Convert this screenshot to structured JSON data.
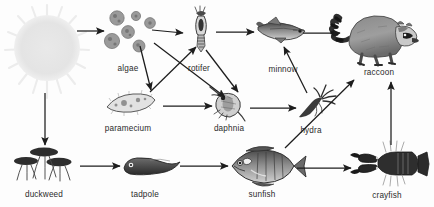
{
  "diagram": {
    "type": "food-web",
    "background_color": "#fdfdfd",
    "arrow_color": "#1d1d1d",
    "label_color": "#2b2b2b",
    "organism_ink": "#3a3a3a",
    "sun_color": "#e6e6e6"
  },
  "nodes": [
    {
      "id": "sun",
      "label": "",
      "x": 47,
      "y": 48,
      "label_x": 47,
      "label_y": 96,
      "kind": "energy-source"
    },
    {
      "id": "algae",
      "label": "algae",
      "x": 131,
      "y": 30,
      "label_x": 128,
      "label_y": 64,
      "kind": "producer"
    },
    {
      "id": "rotifer",
      "label": "rotifer",
      "x": 201,
      "y": 32,
      "label_x": 199,
      "label_y": 64,
      "kind": "primary-consumer"
    },
    {
      "id": "minnow",
      "label": "minnow",
      "x": 283,
      "y": 30,
      "label_x": 283,
      "label_y": 65,
      "kind": "secondary-consumer"
    },
    {
      "id": "raccoon",
      "label": "raccoon",
      "x": 381,
      "y": 33,
      "label_x": 379,
      "label_y": 68,
      "kind": "top-predator"
    },
    {
      "id": "paramecium",
      "label": "paramecium",
      "x": 131,
      "y": 103,
      "label_x": 128,
      "label_y": 124,
      "kind": "primary-consumer"
    },
    {
      "id": "daphnia",
      "label": "daphnia",
      "x": 230,
      "y": 104,
      "label_x": 229,
      "label_y": 124,
      "kind": "primary-consumer"
    },
    {
      "id": "hydra",
      "label": "hydra",
      "x": 313,
      "y": 104,
      "label_x": 311,
      "label_y": 126,
      "kind": "secondary-consumer"
    },
    {
      "id": "duckweed",
      "label": "duckweed",
      "x": 44,
      "y": 165,
      "label_x": 44,
      "label_y": 190,
      "kind": "producer"
    },
    {
      "id": "tadpole",
      "label": "tadpole",
      "x": 145,
      "y": 166,
      "label_x": 145,
      "label_y": 190,
      "kind": "primary-consumer"
    },
    {
      "id": "sunfish",
      "label": "sunfish",
      "x": 262,
      "y": 165,
      "label_x": 262,
      "label_y": 190,
      "kind": "secondary-consumer"
    },
    {
      "id": "crayfish",
      "label": "crayfish",
      "x": 389,
      "y": 165,
      "label_x": 387,
      "label_y": 191,
      "kind": "secondary-consumer"
    }
  ],
  "links": [
    {
      "from": "sun",
      "to": "algae",
      "x1": 77,
      "y1": 31,
      "x2": 104,
      "y2": 31
    },
    {
      "from": "sun",
      "to": "duckweed",
      "x1": 45,
      "y1": 93,
      "x2": 45,
      "y2": 145
    },
    {
      "from": "algae",
      "to": "rotifer",
      "x1": 152,
      "y1": 30,
      "x2": 183,
      "y2": 33
    },
    {
      "from": "algae",
      "to": "paramecium",
      "x1": 140,
      "y1": 46,
      "x2": 151,
      "y2": 90
    },
    {
      "from": "algae",
      "to": "daphnia",
      "x1": 154,
      "y1": 43,
      "x2": 225,
      "y2": 97
    },
    {
      "from": "paramecium",
      "to": "rotifer",
      "x1": 150,
      "y1": 92,
      "x2": 196,
      "y2": 47
    },
    {
      "from": "paramecium",
      "to": "daphnia",
      "x1": 163,
      "y1": 106,
      "x2": 212,
      "y2": 106
    },
    {
      "from": "rotifer",
      "to": "daphnia",
      "x1": 206,
      "y1": 50,
      "x2": 238,
      "y2": 92
    },
    {
      "from": "rotifer",
      "to": "minnow",
      "x1": 216,
      "y1": 32,
      "x2": 254,
      "y2": 32
    },
    {
      "from": "daphnia",
      "to": "hydra",
      "x1": 250,
      "y1": 108,
      "x2": 296,
      "y2": 108
    },
    {
      "from": "hydra",
      "to": "minnow",
      "x1": 307,
      "y1": 93,
      "x2": 284,
      "y2": 47
    },
    {
      "from": "minnow",
      "to": "raccoon",
      "x1": 303,
      "y1": 33,
      "x2": 340,
      "y2": 33
    },
    {
      "from": "duckweed",
      "to": "tadpole",
      "x1": 80,
      "y1": 166,
      "x2": 120,
      "y2": 166
    },
    {
      "from": "tadpole",
      "to": "sunfish",
      "x1": 180,
      "y1": 166,
      "x2": 228,
      "y2": 166
    },
    {
      "from": "sunfish",
      "to": "crayfish",
      "x1": 297,
      "y1": 168,
      "x2": 351,
      "y2": 168
    },
    {
      "from": "sunfish",
      "to": "raccoon",
      "x1": 285,
      "y1": 148,
      "x2": 354,
      "y2": 80
    },
    {
      "from": "crayfish",
      "to": "raccoon",
      "x1": 391,
      "y1": 145,
      "x2": 391,
      "y2": 82
    }
  ]
}
